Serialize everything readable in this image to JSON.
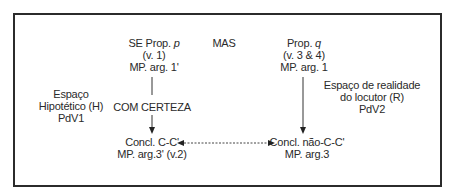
{
  "diagram": {
    "top_left": {
      "line1": "SE Prop. ",
      "var": "p",
      "line2": "(v. 1)",
      "line3": "MP. arg. 1'"
    },
    "connector_top": "MAS",
    "top_right": {
      "line1": "Prop. ",
      "var": "q",
      "line2": "(v. 3 & 4)",
      "line3": "MP. arg. 1"
    },
    "left_space": {
      "line1": "Espaço",
      "line2": "Hipotético (H)",
      "line3": "PdV1"
    },
    "right_space": {
      "line1": "Espaço de realidade",
      "line2": "do locutor (R)",
      "line3": "PdV2"
    },
    "left_arrow_label": "COM CERTEZA",
    "bottom_left": {
      "line1": "Concl. C-C'",
      "line2": "MP. arg.3' (v.2)"
    },
    "bottom_right": {
      "line1": "Concl. não-C-C'",
      "line2": "MP. arg.3"
    }
  }
}
